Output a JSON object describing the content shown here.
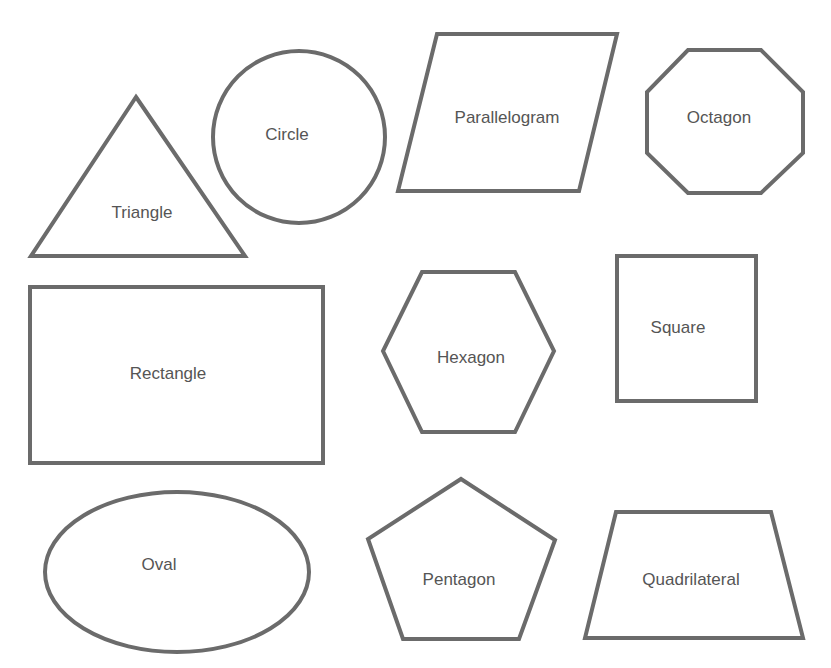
{
  "diagram": {
    "title": "",
    "stroke_color": "#6b6b6b",
    "label_color": "#555555",
    "background": "#ffffff",
    "shapes": [
      {
        "name": "triangle",
        "label": "Triangle"
      },
      {
        "name": "circle",
        "label": "Circle"
      },
      {
        "name": "parallelogram",
        "label": "Parallelogram"
      },
      {
        "name": "octagon",
        "label": "Octagon"
      },
      {
        "name": "rectangle",
        "label": "Rectangle"
      },
      {
        "name": "hexagon",
        "label": "Hexagon"
      },
      {
        "name": "square",
        "label": "Square"
      },
      {
        "name": "oval",
        "label": "Oval"
      },
      {
        "name": "pentagon",
        "label": "Pentagon"
      },
      {
        "name": "quadrilateral",
        "label": "Quadrilateral"
      }
    ]
  }
}
